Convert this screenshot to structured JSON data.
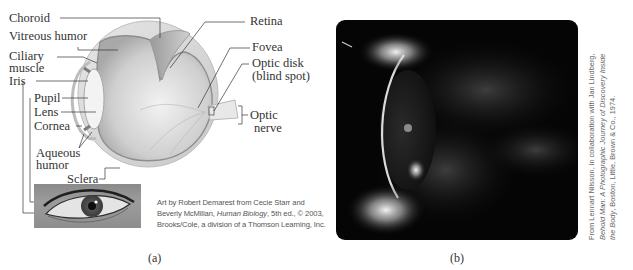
{
  "figure": {
    "panel_a": {
      "label": "(a)",
      "diagram_labels": {
        "choroid": "Choroid",
        "vitreous_humor": "Vitreous humor",
        "ciliary_muscle_1": "Ciliary",
        "ciliary_muscle_2": "muscle",
        "iris": "Iris",
        "pupil": "Pupil",
        "lens": "Lens",
        "cornea": "Cornea",
        "aqueous_humor_1": "Aqueous",
        "aqueous_humor_2": "humor",
        "sclera": "Sclera",
        "retina": "Retina",
        "fovea": "Fovea",
        "optic_disk_1": "Optic disk",
        "optic_disk_2": "(blind spot)",
        "optic_nerve_1": "Optic",
        "optic_nerve_2": "nerve"
      },
      "credit": {
        "line1": "Art by Robert Demarest from Cecie Starr and",
        "line2_pre": "Beverly McMillan, ",
        "line2_title": "Human Biology",
        "line2_post": ", 5th ed., © 2003,",
        "line3": "Brooks/Cole, a division of a Thomson Learning, Inc."
      }
    },
    "panel_b": {
      "label": "(b)",
      "credit": {
        "line1": "From Lennart Nilsson, in collaboration with Jan Lindberg,",
        "line2_title": "Behold Man: A Photographic Journey of Discovery Inside",
        "line3_title": "the Body",
        "line3_post": ", Boston, Little, Brown & Co., 1974."
      }
    }
  }
}
